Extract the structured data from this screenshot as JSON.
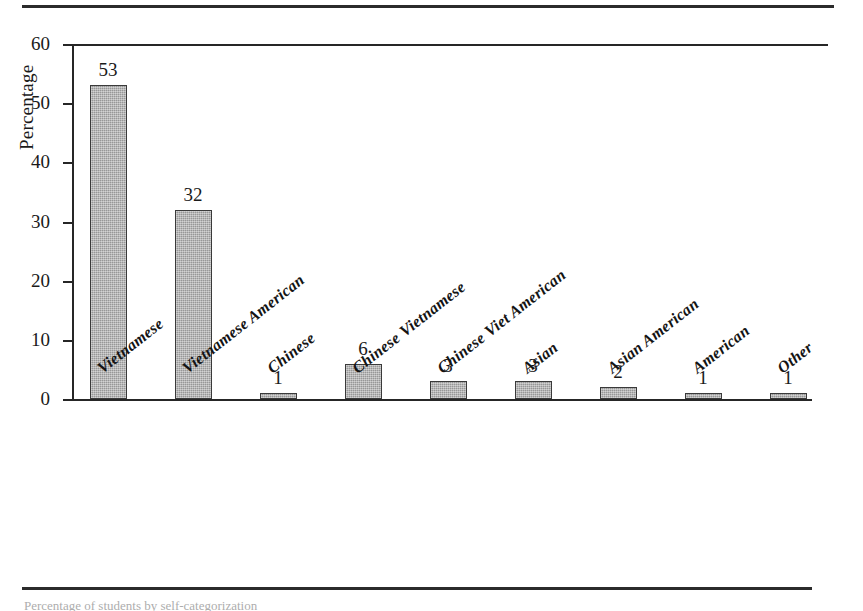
{
  "figure": {
    "caption_sliver": "Percentage of students by self-categorization"
  },
  "chart_data": {
    "type": "bar",
    "title": "",
    "xlabel": "",
    "ylabel": "Percentage",
    "ylim": [
      0,
      60
    ],
    "ytick_step": 10,
    "yticks": [
      0,
      10,
      20,
      30,
      40,
      50,
      60
    ],
    "ytick_labels": [
      "0",
      "10",
      "20",
      "30",
      "40",
      "50",
      "60"
    ],
    "grid": false,
    "legend": false,
    "categories": [
      "Vietnamese",
      "Vietnamese American",
      "Chinese",
      "Chinese Vietnamese",
      "Chinese Viet American",
      "Asian",
      "Asian American",
      "American",
      "Other"
    ],
    "values": [
      53,
      32,
      1,
      6,
      3,
      3,
      2,
      1,
      1
    ],
    "data_labels": [
      "53",
      "32",
      "1",
      "6",
      "3",
      "3",
      "2",
      "1",
      "1"
    ],
    "bar_color": "#a9a9a9",
    "bar_edge_color": "#3a3a3a",
    "axis_color": "#262626"
  }
}
